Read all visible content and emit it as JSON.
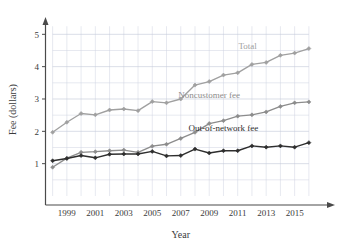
{
  "chart_data": {
    "type": "line",
    "title": "",
    "xlabel": "Year",
    "ylabel": "Fee (dollars)",
    "xlim": [
      1997.5,
      2016.5
    ],
    "ylim": [
      0,
      5.35
    ],
    "xticks": [
      1999,
      2001,
      2003,
      2005,
      2007,
      2009,
      2011,
      2013,
      2015
    ],
    "xtick_labels": [
      "1999",
      "2001",
      "2003",
      "2005",
      "2007",
      "2009",
      "2011",
      "2013",
      "2015"
    ],
    "yticks": [
      1,
      2,
      3,
      4,
      5
    ],
    "ytick_labels": [
      "1",
      "2",
      "3",
      "4",
      "5"
    ],
    "grid": true,
    "grid_x_step": 1,
    "grid_y_step": 0.5,
    "legend_position": "inline-labels",
    "x": [
      1998,
      1999,
      2000,
      2001,
      2002,
      2003,
      2004,
      2005,
      2006,
      2007,
      2008,
      2009,
      2010,
      2011,
      2012,
      2013,
      2014,
      2015,
      2016
    ],
    "series": [
      {
        "name": "Total",
        "color": "#a0a0a0",
        "label_text": "Total",
        "values": [
          1.97,
          2.28,
          2.55,
          2.51,
          2.66,
          2.69,
          2.64,
          2.92,
          2.88,
          3.0,
          3.43,
          3.54,
          3.74,
          3.81,
          4.07,
          4.13,
          4.35,
          4.42,
          4.56
        ]
      },
      {
        "name": "Noncustomer fee",
        "color": "#8c8c8c",
        "label_text": "Noncustomer fee",
        "values": [
          0.89,
          1.17,
          1.35,
          1.37,
          1.4,
          1.42,
          1.35,
          1.54,
          1.6,
          1.78,
          1.97,
          2.24,
          2.33,
          2.47,
          2.51,
          2.6,
          2.77,
          2.88,
          2.91
        ]
      },
      {
        "name": "Out-of-network fee",
        "color": "#2e2e2e",
        "label_text": "Out-of-network fee",
        "values": [
          1.09,
          1.16,
          1.25,
          1.18,
          1.29,
          1.3,
          1.3,
          1.38,
          1.24,
          1.25,
          1.45,
          1.33,
          1.4,
          1.4,
          1.55,
          1.51,
          1.55,
          1.51,
          1.65
        ]
      }
    ],
    "annotations": [
      {
        "text": "Total",
        "x": 2011.7,
        "y": 4.55,
        "color": "#a0a0a0"
      },
      {
        "text": "Noncustomer fee",
        "x": 2009.0,
        "y": 3.02,
        "color": "#8c8c8c"
      },
      {
        "text": "Out-of-network fee",
        "x": 2010.0,
        "y": 2.02,
        "color": "#2e2e2e"
      }
    ]
  }
}
